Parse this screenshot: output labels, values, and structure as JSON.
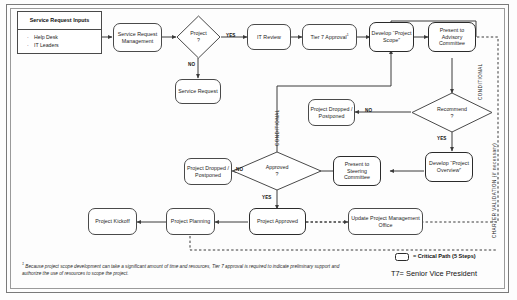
{
  "diagram": {
    "inputs_box": {
      "title": "Service Request Inputs",
      "items": [
        "Help Desk",
        "IT Leaders"
      ],
      "bullet_glyph": "·"
    },
    "nodes": {
      "service_request_management": "Service Request Management",
      "service_request": "Service Request",
      "it_review": "IT Review",
      "tier7_approval": "Tier 7 Approval",
      "tier7_footnote_marker": "1",
      "develop_project_scope": "Develop “Project Scope”",
      "present_to_advisory_committee": "Present to Advisory Committee",
      "project_dropped_postponed_top": "Project Dropped / Postponed",
      "develop_project_overview": "Develop “Project Overview”",
      "present_to_steering_committee": "Present to Steering Committee",
      "project_dropped_postponed_bottom": "Project Dropped / Postponed",
      "project_approved": "Project Approved",
      "update_pmo": "Update Project Management Office",
      "project_planning": "Project Planning",
      "project_kickoff": "Project Kickoff"
    },
    "decisions": {
      "project": "Project ?",
      "project_line1": "Project",
      "project_line2": "?",
      "recommend_line1": "Recommend",
      "recommend_line2": "?",
      "approved_line1": "Approved",
      "approved_line2": "?"
    },
    "edge_labels": {
      "project_yes": "YES",
      "project_no": "NO",
      "recommend_no": "NO",
      "recommend_yes": "YES",
      "approved_no": "NO",
      "approved_yes": "YES"
    },
    "annotations": {
      "conditional_left": "CONDITIONAL",
      "conditional_right": "CONDITIONAL",
      "charter_validation": "CHARTER VALIDATION (if necessary)"
    },
    "legend": {
      "critical_path": "= Critical Path (5 Steps)",
      "t7": "T7= Senior Vice President"
    },
    "footnote": {
      "marker": "1",
      "text": "Because project scope development can take a significant amount of time and resources, Tier 7 approval is required to indicate preliminary support and authorize the use of resources to scope the project."
    },
    "colors": {
      "line": "#3b3b3b",
      "node_border": "#4a4a4a",
      "critical_border": "#2b2b2b",
      "background": "#fdfdfd"
    }
  }
}
